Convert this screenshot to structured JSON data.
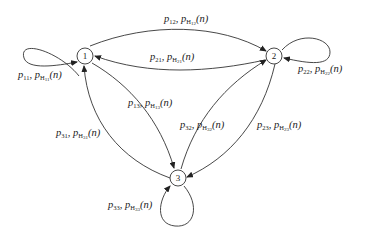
{
  "diagram": {
    "type": "state-transition-graph",
    "nodes": [
      {
        "id": "1",
        "label": "1"
      },
      {
        "id": "2",
        "label": "2"
      },
      {
        "id": "3",
        "label": "3"
      }
    ],
    "edges": [
      {
        "from": "1",
        "to": "1",
        "p": "p",
        "p_sub": "11",
        "h": "p",
        "h_sub": "H",
        "h_subsub": "11",
        "arg": "(n)"
      },
      {
        "from": "1",
        "to": "2",
        "p": "p",
        "p_sub": "12",
        "h": "p",
        "h_sub": "H",
        "h_subsub": "12",
        "arg": "(n)"
      },
      {
        "from": "2",
        "to": "1",
        "p": "p",
        "p_sub": "21",
        "h": "p",
        "h_sub": "H",
        "h_subsub": "21",
        "arg": "(n)"
      },
      {
        "from": "2",
        "to": "2",
        "p": "p",
        "p_sub": "22",
        "h": "p",
        "h_sub": "H",
        "h_subsub": "22",
        "arg": "(n)"
      },
      {
        "from": "1",
        "to": "3",
        "p": "p",
        "p_sub": "13",
        "h": "p",
        "h_sub": "H",
        "h_subsub": "13",
        "arg": "(n)"
      },
      {
        "from": "3",
        "to": "1",
        "p": "p",
        "p_sub": "31",
        "h": "p",
        "h_sub": "H",
        "h_subsub": "31",
        "arg": "(n)"
      },
      {
        "from": "3",
        "to": "2",
        "p": "p",
        "p_sub": "32",
        "h": "p",
        "h_sub": "H",
        "h_subsub": "32",
        "arg": "(n)"
      },
      {
        "from": "2",
        "to": "3",
        "p": "p",
        "p_sub": "23",
        "h": "p",
        "h_sub": "H",
        "h_subsub": "23",
        "arg": "(n)"
      },
      {
        "from": "3",
        "to": "3",
        "p": "p",
        "p_sub": "33",
        "h": "p",
        "h_sub": "H",
        "h_subsub": "33",
        "arg": "(n)"
      }
    ],
    "separator": ","
  }
}
